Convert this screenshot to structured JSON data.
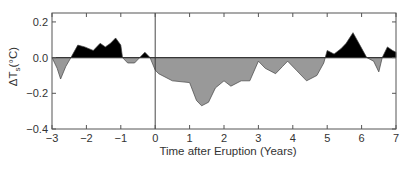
{
  "chart_data": {
    "type": "area",
    "title": "",
    "xlabel": "Time after Eruption (Years)",
    "ylabel": "ΔT_s (°C)",
    "ylabel_main": "ΔT",
    "ylabel_sub": "s",
    "ylabel_unit": "(°C)",
    "xlim": [
      -3,
      7
    ],
    "ylim": [
      -0.4,
      0.25
    ],
    "xticks": [
      -3,
      -2,
      -1,
      0,
      1,
      2,
      3,
      4,
      5,
      6,
      7
    ],
    "xtick_labels": [
      "−3",
      "−2",
      "−1",
      "0",
      "1",
      "2",
      "3",
      "4",
      "5",
      "6",
      "7"
    ],
    "yticks": [
      0.2,
      0.0,
      -0.2,
      -0.4
    ],
    "ytick_labels": [
      "0.2",
      "0.0",
      "−0.2",
      "−0.4"
    ],
    "grid": false,
    "reference_line": {
      "x": 0,
      "label": "eruption"
    },
    "fill_colors": {
      "positive": "#000000",
      "negative": "#999999"
    },
    "series": [
      {
        "name": "Surface temperature anomaly",
        "x": [
          -3.0,
          -2.85,
          -2.75,
          -2.6,
          -2.45,
          -2.25,
          -2.05,
          -1.8,
          -1.6,
          -1.45,
          -1.3,
          -1.15,
          -1.0,
          -0.95,
          -0.8,
          -0.6,
          -0.45,
          -0.3,
          -0.15,
          0.0,
          0.1,
          0.5,
          1.0,
          1.2,
          1.35,
          1.55,
          1.75,
          2.0,
          2.2,
          2.5,
          2.75,
          3.0,
          3.2,
          3.5,
          3.7,
          3.85,
          4.1,
          4.4,
          4.7,
          4.9,
          5.0,
          5.2,
          5.4,
          5.55,
          5.75,
          5.95,
          6.15,
          6.35,
          6.5,
          6.6,
          6.75,
          6.9,
          7.0
        ],
        "y": [
          0.0,
          -0.06,
          -0.12,
          -0.05,
          0.0,
          0.07,
          0.06,
          0.04,
          0.08,
          0.06,
          0.08,
          0.11,
          0.07,
          0.0,
          -0.03,
          -0.03,
          0.0,
          0.03,
          0.0,
          -0.07,
          -0.09,
          -0.13,
          -0.14,
          -0.24,
          -0.27,
          -0.25,
          -0.17,
          -0.13,
          -0.16,
          -0.13,
          -0.13,
          -0.02,
          -0.06,
          -0.09,
          -0.05,
          -0.02,
          -0.07,
          -0.13,
          -0.1,
          -0.03,
          0.04,
          0.02,
          0.05,
          0.08,
          0.14,
          0.07,
          0.0,
          -0.02,
          -0.08,
          0.0,
          0.06,
          0.04,
          0.03
        ]
      }
    ]
  }
}
